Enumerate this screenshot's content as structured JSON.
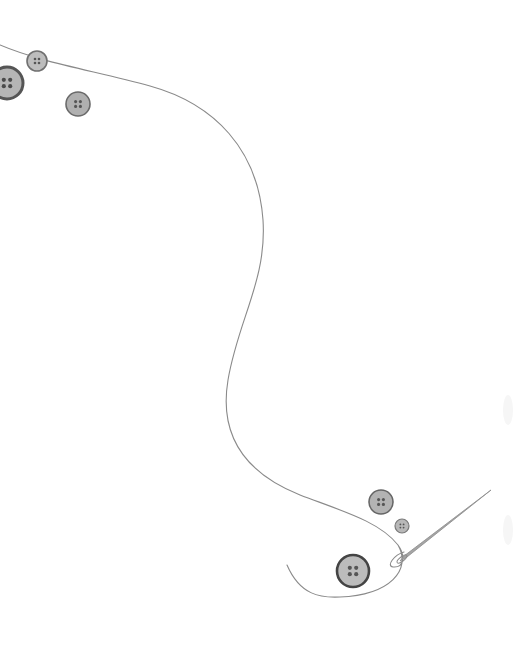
{
  "scene": {
    "description": "Sewing illustration: a thread winding from top-left to bottom-right ending in a needle, with scattered buttons",
    "background": "#ffffff",
    "thread_color": "#8a8a8a",
    "needle_color": "#9a9a9a"
  },
  "buttons": [
    {
      "id": "button-top-small",
      "cx": 37,
      "cy": 61,
      "r": 10,
      "fill": "#bdbdbd",
      "rim": "#707070",
      "rim_width": 1.6,
      "hole_color": "#555555"
    },
    {
      "id": "button-top-large",
      "cx": 7,
      "cy": 83,
      "r": 16,
      "fill": "#b5b5b5",
      "rim": "#555555",
      "rim_width": 3,
      "hole_color": "#4a4a4a"
    },
    {
      "id": "button-top-medium",
      "cx": 78,
      "cy": 104,
      "r": 12,
      "fill": "#b0b0b0",
      "rim": "#6a6a6a",
      "rim_width": 1.6,
      "hole_color": "#555555"
    },
    {
      "id": "button-bottom-medium",
      "cx": 381,
      "cy": 502,
      "r": 12,
      "fill": "#b3b3b3",
      "rim": "#666666",
      "rim_width": 1.6,
      "hole_color": "#555555"
    },
    {
      "id": "button-bottom-small",
      "cx": 402,
      "cy": 526,
      "r": 7,
      "fill": "#b8b8b8",
      "rim": "#7a7a7a",
      "rim_width": 1.2,
      "hole_color": "#555555"
    },
    {
      "id": "button-bottom-large",
      "cx": 353,
      "cy": 571,
      "r": 16,
      "fill": "#bcbcbc",
      "rim": "#444444",
      "rim_width": 2.6,
      "hole_color": "#555555"
    }
  ],
  "needle": {
    "tip": [
      491,
      490
    ],
    "eye": [
      400,
      563
    ]
  }
}
